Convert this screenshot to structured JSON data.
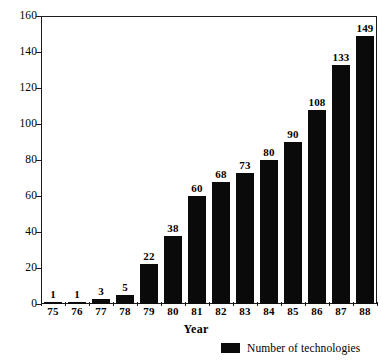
{
  "chart_data": {
    "type": "bar",
    "title": "",
    "xlabel": "Year",
    "ylabel": "",
    "categories": [
      "75",
      "76",
      "77",
      "78",
      "79",
      "80",
      "81",
      "82",
      "83",
      "84",
      "85",
      "86",
      "87",
      "88"
    ],
    "values": [
      1,
      1,
      3,
      5,
      22,
      38,
      60,
      68,
      73,
      80,
      90,
      108,
      133,
      149
    ],
    "series": [
      {
        "name": "Number of technologies",
        "color": "#0a0a0a",
        "values": [
          1,
          1,
          3,
          5,
          22,
          38,
          60,
          68,
          73,
          80,
          90,
          108,
          133,
          149
        ]
      }
    ],
    "ylim": [
      0,
      160
    ],
    "y_ticks": [
      0,
      20,
      40,
      60,
      80,
      100,
      120,
      140,
      160
    ],
    "y_tick_labels": [
      "0",
      "20",
      "40",
      "60",
      "80",
      "100",
      "120",
      "140",
      "160"
    ],
    "grid": false,
    "data_labels": true,
    "legend": {
      "position": "bottom-right",
      "entries": [
        {
          "label": "Number of technologies",
          "color": "#0a0a0a",
          "swatch": "filled-square"
        }
      ]
    },
    "axis_color": "#1b1b1b",
    "background": "#ffffff"
  }
}
